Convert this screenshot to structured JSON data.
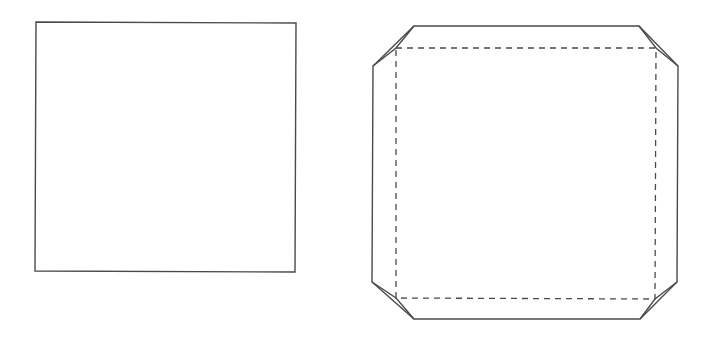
{
  "diagram": {
    "type": "geometry-net",
    "background": "#ffffff",
    "stroke_color": "#4a4a4a",
    "shapes": [
      {
        "id": "plain-square",
        "kind": "square",
        "style": "solid",
        "points": "36,22 296,23 295,272 35,271"
      },
      {
        "id": "octagon-net",
        "kind": "octagon-outline",
        "style": "solid",
        "points": "414,26 639,26 678,66 677,282 640,319 414,319 372,282 373,66"
      },
      {
        "id": "fold-square",
        "kind": "square",
        "style": "dashed",
        "points": "396,48 656,48 655,299 396,298"
      },
      {
        "id": "corner-creases",
        "kind": "diagonal-connectors",
        "style": "solid",
        "segments": [
          "414,26 396,48 373,66",
          "639,26 656,48 678,66",
          "677,282 655,299 640,319",
          "372,282 396,298 414,319"
        ]
      }
    ]
  }
}
